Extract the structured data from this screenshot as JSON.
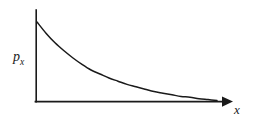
{
  "figure": {
    "background_color": "#ffffff",
    "ink_color": "#1a1a1a",
    "width": 253,
    "height": 121
  },
  "labels": {
    "ylabel_base": "p",
    "ylabel_sub": "x",
    "xlabel": "x"
  },
  "chart_data": {
    "type": "line",
    "title": "",
    "subtitle": "",
    "xlabel": "x",
    "ylabel": "p_x",
    "grid": false,
    "legend": null,
    "annotations": [],
    "xlim": [
      0,
      1
    ],
    "ylim": [
      0,
      1
    ],
    "axis_style": {
      "y_axis_arrow": false,
      "x_axis_arrow": true,
      "ticks": "none",
      "tick_labels": "none",
      "spines": [
        "left",
        "bottom"
      ]
    },
    "series": [
      {
        "name": "p_x",
        "x": [
          0.0,
          0.05,
          0.1,
          0.15,
          0.2,
          0.25,
          0.3,
          0.35,
          0.4,
          0.45,
          0.5,
          0.55,
          0.6,
          0.65,
          0.7,
          0.75,
          0.8,
          0.85,
          0.9,
          0.95,
          1.0
        ],
        "values": [
          1.0,
          0.86,
          0.74,
          0.64,
          0.55,
          0.47,
          0.4,
          0.35,
          0.3,
          0.26,
          0.22,
          0.19,
          0.16,
          0.13,
          0.11,
          0.09,
          0.07,
          0.06,
          0.04,
          0.03,
          0.02
        ]
      }
    ]
  },
  "geometry": {
    "origin_px": [
      36,
      102
    ],
    "y_axis_top_px": [
      36,
      10
    ],
    "x_axis_end_px": [
      232,
      102
    ],
    "curve_start_px": [
      37,
      22
    ]
  }
}
